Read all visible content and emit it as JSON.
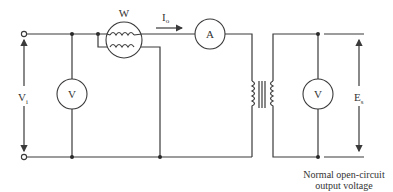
{
  "diagram": {
    "type": "circuit-schematic",
    "title": "",
    "labels": {
      "input_voltage": "V",
      "input_voltage_sub": "i",
      "wattmeter": "W",
      "current": "I",
      "current_sub": "o",
      "ammeter": "A",
      "input_voltmeter": "V",
      "output_voltmeter": "V",
      "output_voltage": "E",
      "output_voltage_sub": "s"
    },
    "caption": {
      "line1": "Normal open-circuit",
      "line2": "output voltage"
    },
    "components": [
      {
        "id": "input-terminals",
        "kind": "terminal-pair"
      },
      {
        "id": "input-voltmeter",
        "kind": "voltmeter",
        "label": "V"
      },
      {
        "id": "wattmeter",
        "kind": "wattmeter",
        "label": "W"
      },
      {
        "id": "ammeter",
        "kind": "ammeter",
        "label": "A"
      },
      {
        "id": "transformer",
        "kind": "iron-core-transformer"
      },
      {
        "id": "output-voltmeter",
        "kind": "voltmeter",
        "label": "V"
      }
    ],
    "colors": {
      "line": "#3a3a3a",
      "background": "#ffffff"
    }
  }
}
